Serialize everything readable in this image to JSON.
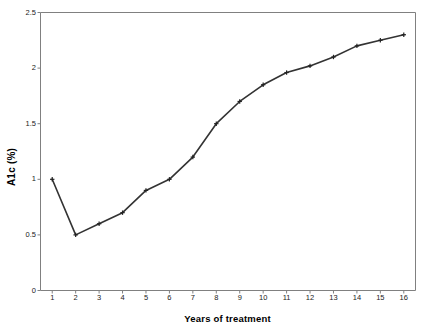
{
  "chart_data": {
    "type": "line",
    "title": "",
    "xlabel": "Years of treatment",
    "ylabel": "A1c (%)",
    "x": [
      1,
      2,
      3,
      4,
      5,
      6,
      7,
      8,
      9,
      10,
      11,
      12,
      13,
      14,
      15,
      16
    ],
    "values": [
      1.0,
      0.5,
      0.6,
      0.7,
      0.9,
      1.0,
      1.2,
      1.5,
      1.7,
      1.85,
      1.96,
      2.02,
      2.1,
      2.2,
      2.25,
      2.3
    ],
    "series": [
      {
        "name": "A1c",
        "values": [
          1.0,
          0.5,
          0.6,
          0.7,
          0.9,
          1.0,
          1.2,
          1.5,
          1.7,
          1.85,
          1.96,
          2.02,
          2.1,
          2.2,
          2.25,
          2.3
        ]
      }
    ],
    "categories": [
      "1",
      "2",
      "3",
      "4",
      "5",
      "6",
      "7",
      "8",
      "9",
      "10",
      "11",
      "12",
      "13",
      "14",
      "15",
      "16"
    ],
    "xlim": [
      0.5,
      16.5
    ],
    "ylim": [
      0,
      2.5
    ],
    "yticks": [
      0,
      0.5,
      1,
      1.5,
      2,
      2.5
    ],
    "ytick_labels": [
      "0",
      "0.5",
      "1",
      "1.5",
      "2",
      "2.5"
    ],
    "xticks": [
      1,
      2,
      3,
      4,
      5,
      6,
      7,
      8,
      9,
      10,
      11,
      12,
      13,
      14,
      15,
      16
    ],
    "xtick_labels": [
      "1",
      "2",
      "3",
      "4",
      "5",
      "6",
      "7",
      "8",
      "9",
      "10",
      "11",
      "12",
      "13",
      "14",
      "15",
      "16"
    ],
    "grid": false,
    "legend": "none",
    "line_color": "#333333",
    "marker": "plus",
    "marker_color": "#222222",
    "axis_color": "#808080",
    "background_color": "#ffffff"
  }
}
